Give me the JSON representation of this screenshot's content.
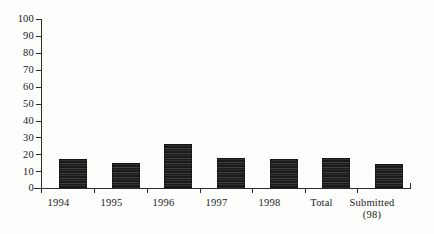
{
  "chart_data": {
    "type": "bar",
    "title": "",
    "subtitle": "",
    "xlabel": "",
    "ylabel": "",
    "ylim": [
      0,
      100
    ],
    "ytick_step": 10,
    "grid": false,
    "legend": "none",
    "bar_color": "#1a1a1a",
    "axis_color": "#2b2b2b",
    "categories": [
      "1994",
      "1995",
      "1996",
      "1997",
      "1998",
      "Total",
      "Submitted"
    ],
    "category_sublabels": [
      "",
      "",
      "",
      "",
      "",
      "",
      "(98)"
    ],
    "values": [
      17,
      15,
      26,
      18,
      17,
      18,
      14
    ],
    "ytick_labels": [
      "0",
      "10",
      "20",
      "30",
      "40",
      "50",
      "60",
      "70",
      "80",
      "90",
      "100"
    ]
  },
  "axis": {
    "y_labels": [
      "100",
      "90",
      "80",
      "70",
      "60",
      "50",
      "40",
      "30",
      "20",
      "10",
      "0"
    ]
  }
}
